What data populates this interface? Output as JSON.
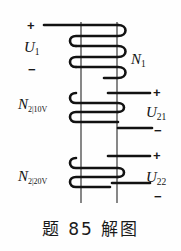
{
  "figure": {
    "caption": "题 85 解图",
    "primary": {
      "plus": "+",
      "minus": "−",
      "voltage_label": "U",
      "voltage_sub": "1",
      "turns_label": "N",
      "turns_sub": "1"
    },
    "secondary_1": {
      "turns_label": "N",
      "turns_sub": "2|10V",
      "plus": "+",
      "minus": "−",
      "voltage_label": "U",
      "voltage_sub": "21"
    },
    "secondary_2": {
      "turns_label": "N",
      "turns_sub": "2|20V",
      "plus": "+",
      "minus": "−",
      "voltage_label": "U",
      "voltage_sub": "22"
    },
    "colors": {
      "ink": "#1a1a1a",
      "background": "#fefefe",
      "core": "#555555"
    }
  }
}
